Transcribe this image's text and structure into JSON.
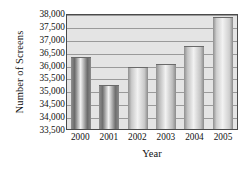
{
  "chart_data": {
    "type": "bar",
    "title": "",
    "xlabel": "Year",
    "ylabel": "Number of Screens",
    "categories": [
      "2000",
      "2001",
      "2002",
      "2003",
      "2004",
      "2005"
    ],
    "values": [
      36250,
      35150,
      35875,
      36000,
      36700,
      37800
    ],
    "ylim": [
      33500,
      38000
    ],
    "ytick_labels": [
      "38,000",
      "37,500",
      "37,000",
      "36,500",
      "36,000",
      "35,500",
      "35,000",
      "34,500",
      "34,000",
      "33,500"
    ],
    "ytick_values": [
      38000,
      37500,
      37000,
      36500,
      36000,
      35500,
      35000,
      34500,
      34000,
      33500
    ],
    "grid": true,
    "legend": "none",
    "bar_colors": [
      "#6b6b6b",
      "#6f6f6f",
      "#c9c9c9",
      "#bdbdbd",
      "#c4c4c4",
      "#cfcfcf"
    ],
    "plot_background": "#e4e4e4",
    "gridline_color": "#9a9a9a",
    "axis_color": "#4a4a4a"
  }
}
